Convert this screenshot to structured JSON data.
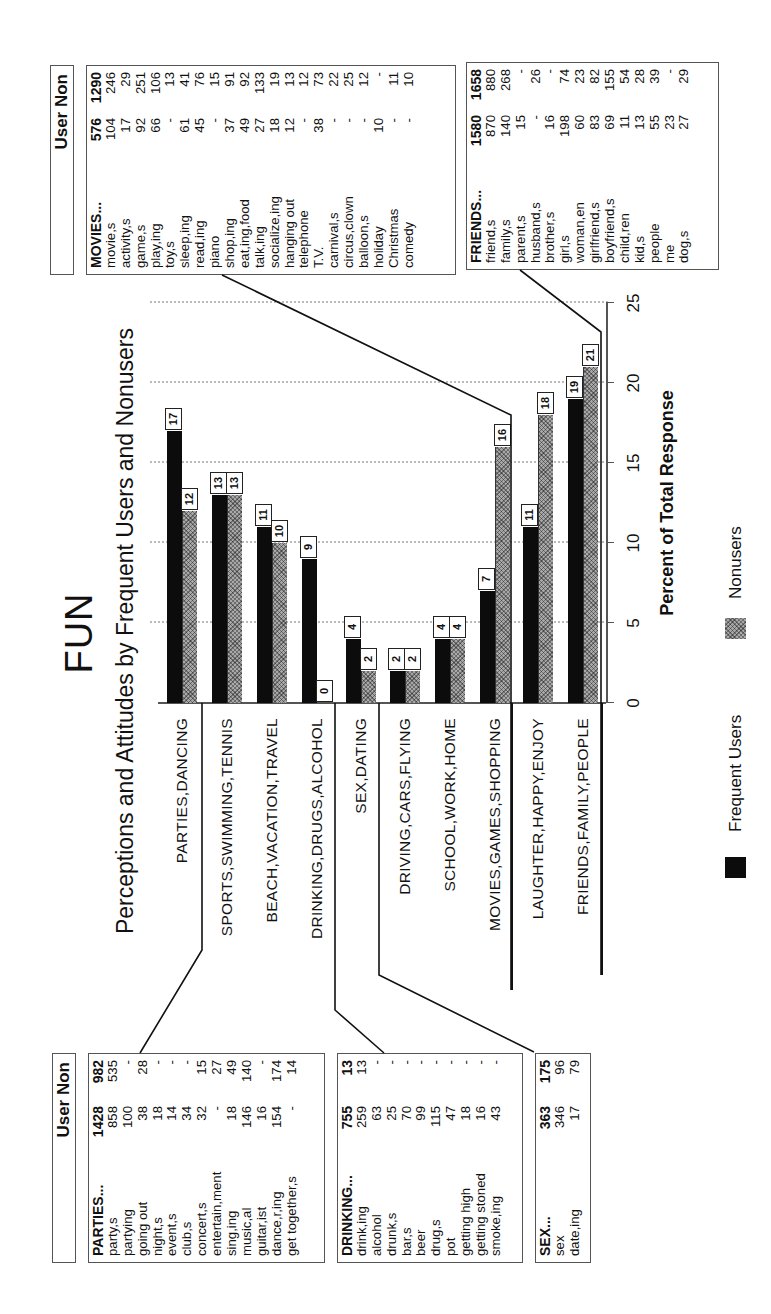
{
  "title": "FUN",
  "subtitle": "Perceptions and Attitudes by Frequent Users and Nonusers",
  "table_header": "User Non",
  "legend": {
    "frequent": "Frequent Users",
    "nonusers": "Nonusers"
  },
  "axis": {
    "title": "Percent of Total Response",
    "ticks": [
      "0",
      "5",
      "10",
      "15",
      "20",
      "25"
    ]
  },
  "categories": [
    {
      "label": "PARTIES,DANCING",
      "freq": "17",
      "non": "12"
    },
    {
      "label": "SPORTS,SWIMMING,TENNIS",
      "freq": "13",
      "non": "13"
    },
    {
      "label": "BEACH,VACATION,TRAVEL",
      "freq": "11",
      "non": "10"
    },
    {
      "label": "DRINKING,DRUGS,ALCOHOL",
      "freq": "9",
      "non": "0"
    },
    {
      "label": "SEX,DATING",
      "freq": "4",
      "non": "2"
    },
    {
      "label": "DRIVING,CARS,FLYING",
      "freq": "2",
      "non": "2"
    },
    {
      "label": "SCHOOL,WORK,HOME",
      "freq": "4",
      "non": "4"
    },
    {
      "label": "MOVIES,GAMES,SHOPPING",
      "freq": "7",
      "non": "16"
    },
    {
      "label": "LAUGHTER,HAPPY,ENJOY",
      "freq": "11",
      "non": "18"
    },
    {
      "label": "FRIENDS,FAMILY,PEOPLE",
      "freq": "19",
      "non": "21"
    }
  ],
  "tables": {
    "parties": [
      [
        "PARTIES...",
        "1428",
        "982"
      ],
      [
        "party,s",
        "858",
        "535"
      ],
      [
        "partying",
        "100",
        "-"
      ],
      [
        "going out",
        "38",
        "28"
      ],
      [
        "night,s",
        "18",
        "-"
      ],
      [
        "event,s",
        "14",
        "-"
      ],
      [
        "club,s",
        "34",
        "-"
      ],
      [
        "concert,s",
        "32",
        "15"
      ],
      [
        "entertain,ment",
        "-",
        "27"
      ],
      [
        "sing,ing",
        "18",
        "49"
      ],
      [
        "music,al",
        "146",
        "140"
      ],
      [
        "guitar,ist",
        "16",
        "-"
      ],
      [
        "dance,r,ing",
        "154",
        "174"
      ],
      [
        "get together,s",
        "-",
        "14"
      ]
    ],
    "drinking": [
      [
        "DRINKING...",
        "755",
        "13"
      ],
      [
        "drink,ing",
        "259",
        "13"
      ],
      [
        "alcohol",
        "63",
        "-"
      ],
      [
        "drunk,s",
        "25",
        "-"
      ],
      [
        "bar,s",
        "70",
        "-"
      ],
      [
        "beer",
        "99",
        "-"
      ],
      [
        "drug,s",
        "115",
        "-"
      ],
      [
        "pot",
        "47",
        "-"
      ],
      [
        "getting high",
        "18",
        "-"
      ],
      [
        "getting stoned",
        "16",
        "-"
      ],
      [
        "smoke,ing",
        "43",
        "-"
      ]
    ],
    "sex": [
      [
        "SEX...",
        "363",
        "175"
      ],
      [
        "sex",
        "346",
        "96"
      ],
      [
        "date,ing",
        "17",
        "79"
      ]
    ],
    "movies": [
      [
        "MOVIES...",
        "576",
        "1290"
      ],
      [
        "movie,s",
        "104",
        "246"
      ],
      [
        "activity,s",
        "17",
        "29"
      ],
      [
        "game,s",
        "92",
        "251"
      ],
      [
        "play,ing",
        "66",
        "106"
      ],
      [
        "toy,s",
        "-",
        "13"
      ],
      [
        "sleep,ing",
        "61",
        "41"
      ],
      [
        "read,ing",
        "45",
        "76"
      ],
      [
        "piano",
        "-",
        "15"
      ],
      [
        "shop,ing",
        "37",
        "91"
      ],
      [
        "eat,ing,food",
        "49",
        "92"
      ],
      [
        "talk,ing",
        "27",
        "133"
      ],
      [
        "socialize,ing",
        "18",
        "19"
      ],
      [
        "hanging out",
        "12",
        "13"
      ],
      [
        "telephone",
        "-",
        "12"
      ],
      [
        "T.V.",
        "38",
        "73"
      ],
      [
        "carnival,s",
        "-",
        "22"
      ],
      [
        "circus,clown",
        "-",
        "25"
      ],
      [
        "balloon,s",
        "-",
        "12"
      ],
      [
        "holiday",
        "10",
        "-"
      ],
      [
        "Christmas",
        "-",
        "11"
      ],
      [
        "comedy",
        "-",
        "10"
      ]
    ],
    "friends": [
      [
        "FRIENDS...",
        "1580",
        "1658"
      ],
      [
        "friend,s",
        "870",
        "880"
      ],
      [
        "family,s",
        "140",
        "268"
      ],
      [
        "parent,s",
        "15",
        "-"
      ],
      [
        "husband,s",
        "-",
        "26"
      ],
      [
        "brother,s",
        "16",
        "-"
      ],
      [
        "girl,s",
        "198",
        "74"
      ],
      [
        "woman,en",
        "60",
        "23"
      ],
      [
        "girlfriend,s",
        "83",
        "82"
      ],
      [
        "boyfriend,s",
        "69",
        "155"
      ],
      [
        "child,ren",
        "11",
        "54"
      ],
      [
        "kid,s",
        "13",
        "28"
      ],
      [
        "people",
        "55",
        "39"
      ],
      [
        "me",
        "23",
        "-"
      ],
      [
        "dog,s",
        "27",
        "29"
      ]
    ]
  },
  "colors": {
    "frequent": "#0c0c0c",
    "nonusers": "#a8a8a8",
    "grid": "#bbbbbb",
    "border": "#555555"
  },
  "chart_data": {
    "type": "bar",
    "orientation": "horizontal",
    "title": "FUN",
    "subtitle": "Perceptions and Attitudes by Frequent Users and Nonusers",
    "xlabel": "Percent of Total Response",
    "ylabel": "",
    "xlim": [
      0,
      25
    ],
    "xticks": [
      0,
      5,
      10,
      15,
      20,
      25
    ],
    "grid": true,
    "legend_position": "bottom",
    "categories": [
      "PARTIES,DANCING",
      "SPORTS,SWIMMING,TENNIS",
      "BEACH,VACATION,TRAVEL",
      "DRINKING,DRUGS,ALCOHOL",
      "SEX,DATING",
      "DRIVING,CARS,FLYING",
      "SCHOOL,WORK,HOME",
      "MOVIES,GAMES,SHOPPING",
      "LAUGHTER,HAPPY,ENJOY",
      "FRIENDS,FAMILY,PEOPLE"
    ],
    "series": [
      {
        "name": "Frequent Users",
        "values": [
          17,
          13,
          11,
          9,
          4,
          2,
          4,
          7,
          11,
          19
        ]
      },
      {
        "name": "Nonusers",
        "values": [
          12,
          13,
          10,
          0,
          2,
          2,
          4,
          16,
          18,
          21
        ]
      }
    ],
    "annotations": "Side tables list word counts (User / Non) for PARTIES, DRINKING, SEX, MOVIES and FRIENDS clusters; connector lines link tables to their categories. Figure is rotated 90° counter-clockwise on the page."
  }
}
